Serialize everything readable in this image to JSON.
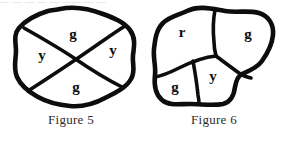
{
  "page": {
    "top_partial_text": "—  —   —    —  —    ——   — —",
    "background_color": "#ffffff",
    "ink_color": "#0d0d0d"
  },
  "figures": [
    {
      "id": "figure-5",
      "caption": "Figure 5",
      "region_count": 4,
      "regions": [
        {
          "name": "top",
          "label": "g",
          "color_code": "green",
          "cx": 73,
          "cy": 36
        },
        {
          "name": "left",
          "label": "y",
          "color_code": "yellow",
          "cx": 42,
          "cy": 57
        },
        {
          "name": "right",
          "label": "y",
          "color_code": "yellow",
          "cx": 113,
          "cy": 52
        },
        {
          "name": "bottom",
          "label": "g",
          "color_code": "green",
          "cx": 76,
          "cy": 89
        }
      ]
    },
    {
      "id": "figure-6",
      "caption": "Figure 6",
      "region_count": 4,
      "regions": [
        {
          "name": "upper-left",
          "label": "r",
          "color_code": "red",
          "cx": 39,
          "cy": 34
        },
        {
          "name": "upper-right",
          "label": "g",
          "color_code": "green",
          "cx": 105,
          "cy": 36
        },
        {
          "name": "lower-left",
          "label": "g",
          "color_code": "green",
          "cx": 32,
          "cy": 89
        },
        {
          "name": "lower-center",
          "label": "y",
          "color_code": "yellow",
          "cx": 70,
          "cy": 78
        }
      ]
    }
  ]
}
